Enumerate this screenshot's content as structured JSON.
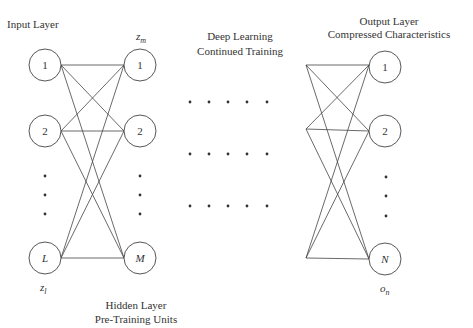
{
  "labels": {
    "input_layer": "Input Layer",
    "hidden_top_var": "z",
    "hidden_top_sub": "m",
    "input_bottom_var": "z",
    "input_bottom_sub": "l",
    "middle_line1": "Deep Learning",
    "middle_line2": "Continued Training",
    "output_line1": "Output Layer",
    "output_line2": "Compressed Characteristics",
    "hidden_line1": "Hidden Layer",
    "hidden_line2": "Pre-Training Units",
    "output_bottom_var": "o",
    "output_bottom_sub": "n"
  },
  "layers": {
    "input": {
      "nodes": [
        "1",
        "2",
        "L"
      ]
    },
    "hidden": {
      "nodes": [
        "1",
        "2",
        "M"
      ]
    },
    "output": {
      "nodes": [
        "1",
        "2",
        "N"
      ]
    }
  },
  "colors": {
    "stroke": "#444444",
    "text": "#333333",
    "background": "#ffffff"
  }
}
